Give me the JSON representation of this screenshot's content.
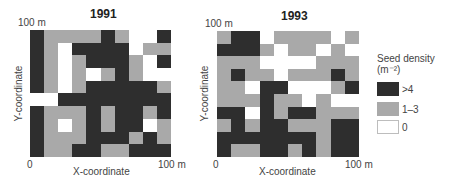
{
  "chart_data": [
    {
      "type": "heatmap",
      "title": "1991",
      "xlabel": "X-coordinate",
      "ylabel": "Y-coordinate",
      "x_ticks": [
        "0",
        "100 m"
      ],
      "y_ticks": [
        "100 m"
      ],
      "xlim": [
        0,
        100
      ],
      "ylim": [
        0,
        100
      ],
      "grid_size": [
        10,
        10
      ],
      "cell_size_m": 10,
      "encoding": {
        "B": ">4",
        "G": "1–3",
        "W": "0"
      },
      "rows_top_to_bottom": [
        [
          "B",
          "G",
          "G",
          "G",
          "G",
          "B",
          "G",
          "W",
          "W",
          "B"
        ],
        [
          "B",
          "G",
          "W",
          "B",
          "B",
          "B",
          "B",
          "W",
          "G",
          "G"
        ],
        [
          "B",
          "G",
          "W",
          "G",
          "B",
          "B",
          "B",
          "G",
          "W",
          "B"
        ],
        [
          "B",
          "G",
          "W",
          "G",
          "W",
          "G",
          "B",
          "G",
          "W",
          "W"
        ],
        [
          "B",
          "G",
          "W",
          "G",
          "B",
          "B",
          "B",
          "B",
          "B",
          "G"
        ],
        [
          "W",
          "W",
          "B",
          "B",
          "B",
          "B",
          "B",
          "B",
          "B",
          "B"
        ],
        [
          "B",
          "G",
          "G",
          "G",
          "B",
          "G",
          "B",
          "B",
          "G",
          "B"
        ],
        [
          "B",
          "G",
          "W",
          "G",
          "B",
          "G",
          "B",
          "B",
          "W",
          "G"
        ],
        [
          "B",
          "G",
          "G",
          "G",
          "B",
          "B",
          "B",
          "G",
          "B",
          "G"
        ],
        [
          "B",
          "G",
          "G",
          "B",
          "B",
          "G",
          "G",
          "B",
          "B",
          "B"
        ]
      ]
    },
    {
      "type": "heatmap",
      "title": "1993",
      "xlabel": "X-coordinate",
      "ylabel": "Y-coordinate",
      "x_ticks": [
        "0",
        "100 m"
      ],
      "y_ticks": [
        "100 m"
      ],
      "xlim": [
        0,
        100
      ],
      "ylim": [
        0,
        100
      ],
      "grid_size": [
        10,
        10
      ],
      "cell_size_m": 10,
      "encoding": {
        "B": ">4",
        "G": "1–3",
        "W": "0"
      },
      "rows_top_to_bottom": [
        [
          "G",
          "B",
          "B",
          "W",
          "G",
          "G",
          "G",
          "G",
          "W",
          "G"
        ],
        [
          "B",
          "B",
          "B",
          "G",
          "W",
          "G",
          "G",
          "W",
          "G",
          "W"
        ],
        [
          "G",
          "G",
          "G",
          "W",
          "W",
          "W",
          "W",
          "G",
          "G",
          "G"
        ],
        [
          "G",
          "B",
          "G",
          "G",
          "W",
          "G",
          "G",
          "G",
          "B",
          "G"
        ],
        [
          "G",
          "G",
          "W",
          "B",
          "B",
          "W",
          "W",
          "W",
          "G",
          "B"
        ],
        [
          "G",
          "G",
          "G",
          "B",
          "G",
          "G",
          "W",
          "G",
          "W",
          "W"
        ],
        [
          "B",
          "B",
          "W",
          "B",
          "G",
          "B",
          "B",
          "G",
          "G",
          "G"
        ],
        [
          "G",
          "B",
          "G",
          "B",
          "B",
          "G",
          "G",
          "G",
          "B",
          "B"
        ],
        [
          "B",
          "B",
          "B",
          "B",
          "B",
          "B",
          "B",
          "G",
          "B",
          "B"
        ],
        [
          "B",
          "G",
          "G",
          "B",
          "B",
          "G",
          "B",
          "G",
          "B",
          "B"
        ]
      ]
    }
  ],
  "panels": [
    {
      "title": "1991",
      "y_top_tick": "100 m",
      "x_origin": "0",
      "x_end_tick": "100 m",
      "xlabel": "X-coordinate",
      "ylabel": "Y-coordinate"
    },
    {
      "title": "1993",
      "y_top_tick": "100 m",
      "x_origin": "0",
      "x_end_tick": "100 m",
      "xlabel": "X-coordinate",
      "ylabel": "Y-coordinate"
    }
  ],
  "legend": {
    "title": "Seed density",
    "unit": "(m⁻²)",
    "items": [
      {
        "label": ">4",
        "color": "#2e2e2e"
      },
      {
        "label": "1–3",
        "color": "#a9a9a9"
      },
      {
        "label": "0",
        "color": "#ffffff"
      }
    ]
  }
}
